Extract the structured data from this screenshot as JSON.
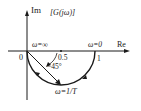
{
  "diagram": {
    "title": "[G(jω)]",
    "axes": {
      "im_label": "Im",
      "re_label": "Re",
      "origin_label": "0"
    },
    "annotations": {
      "omega_inf": "ω=∞",
      "omega_zero": "ω=0",
      "half": "0.5",
      "one": "1",
      "angle": "−45°",
      "omega_1T": "ω=1/T"
    },
    "colors": {
      "stroke": "#1a1a1a",
      "background": "#ffffff"
    }
  }
}
